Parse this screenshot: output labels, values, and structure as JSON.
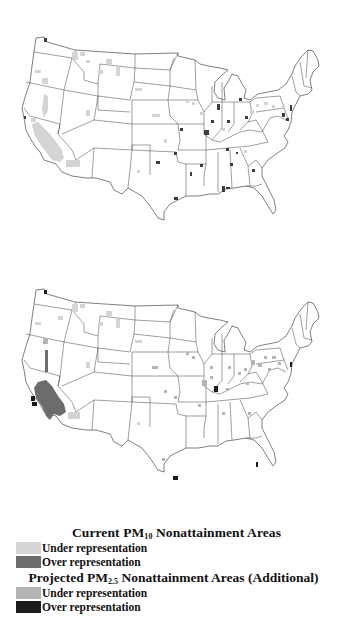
{
  "maps": [
    {
      "id": "current-pm10",
      "description": "Current PM10 nonattainment areas",
      "regions": [
        {
          "class": "pm10-under",
          "shape": "california-central",
          "x": 40,
          "y": 148
        },
        {
          "class": "pm10-under",
          "shape": "blob",
          "x": 75,
          "y": 57
        },
        {
          "class": "pm10-under",
          "shape": "blob",
          "x": 88,
          "y": 62
        },
        {
          "class": "pm10-under",
          "shape": "blob",
          "x": 110,
          "y": 62
        },
        {
          "class": "pm10-under",
          "shape": "blob",
          "x": 118,
          "y": 72
        },
        {
          "class": "pm10-under",
          "shape": "blob",
          "x": 44,
          "y": 84
        },
        {
          "class": "pm10-under",
          "shape": "blob",
          "x": 60,
          "y": 110
        },
        {
          "class": "pm10-under",
          "shape": "blob",
          "x": 88,
          "y": 110
        },
        {
          "class": "pm10-under",
          "shape": "blob",
          "x": 78,
          "y": 162
        },
        {
          "class": "pm10-under",
          "shape": "blob",
          "x": 139,
          "y": 90
        },
        {
          "class": "pm10-under",
          "shape": "blob",
          "x": 155,
          "y": 115
        },
        {
          "class": "pm10-under",
          "shape": "blob",
          "x": 190,
          "y": 100
        },
        {
          "class": "pm10-under",
          "shape": "blob",
          "x": 267,
          "y": 98
        },
        {
          "class": "pm10-under",
          "shape": "blob",
          "x": 282,
          "y": 100
        },
        {
          "class": "pm10-over",
          "shape": "dot",
          "x": 212,
          "y": 118
        },
        {
          "class": "pm10-over",
          "shape": "dot",
          "x": 228,
          "y": 122
        },
        {
          "class": "pm10-over",
          "shape": "dot",
          "x": 246,
          "y": 117
        },
        {
          "class": "pm10-over",
          "shape": "dot",
          "x": 218,
          "y": 108
        },
        {
          "class": "pm10-over",
          "shape": "dot",
          "x": 206,
          "y": 133
        },
        {
          "class": "pm10-over",
          "shape": "dot",
          "x": 228,
          "y": 148
        },
        {
          "class": "pm10-over",
          "shape": "dot",
          "x": 253,
          "y": 170
        },
        {
          "class": "pm10-over",
          "shape": "dot",
          "x": 231,
          "y": 165
        },
        {
          "class": "pm10-over",
          "shape": "dot",
          "x": 200,
          "y": 164
        },
        {
          "class": "pm10-over",
          "shape": "dot",
          "x": 180,
          "y": 130
        },
        {
          "class": "pm10-over",
          "shape": "dot",
          "x": 175,
          "y": 155
        },
        {
          "class": "pm10-over",
          "shape": "dot",
          "x": 157,
          "y": 162
        },
        {
          "class": "pm10-over",
          "shape": "dot",
          "x": 176,
          "y": 199
        },
        {
          "class": "pm10-over",
          "shape": "dot",
          "x": 222,
          "y": 190
        },
        {
          "class": "pm10-over",
          "shape": "dot",
          "x": 283,
          "y": 116
        },
        {
          "class": "pm10-over",
          "shape": "dot",
          "x": 291,
          "y": 110
        },
        {
          "class": "pm10-over",
          "shape": "dot",
          "x": 240,
          "y": 100
        },
        {
          "class": "pm10-over",
          "shape": "dot",
          "x": 45,
          "y": 40
        }
      ]
    },
    {
      "id": "projected-pm25",
      "description": "Projected PM2.5 nonattainment areas (additional)",
      "regions": [
        {
          "class": "pm10-over",
          "shape": "california-central",
          "x": 40,
          "y": 148
        },
        {
          "class": "pm10-over",
          "shape": "owens-strip",
          "x": 45,
          "y": 120
        },
        {
          "class": "pm25-over",
          "shape": "dot",
          "x": 33,
          "y": 147
        },
        {
          "class": "pm25-over",
          "shape": "dot",
          "x": 34,
          "y": 153
        },
        {
          "class": "pm25-over",
          "shape": "dot",
          "x": 216,
          "y": 136
        },
        {
          "class": "pm25-over",
          "shape": "dot",
          "x": 176,
          "y": 228
        },
        {
          "class": "pm10-under",
          "shape": "blob",
          "x": 75,
          "y": 82
        },
        {
          "class": "pm10-under",
          "shape": "blob",
          "x": 108,
          "y": 93
        },
        {
          "class": "pm10-under",
          "shape": "blob",
          "x": 76,
          "y": 190
        },
        {
          "class": "pm25-under",
          "shape": "blob",
          "x": 258,
          "y": 135
        },
        {
          "class": "pm25-under",
          "shape": "blob",
          "x": 275,
          "y": 133
        },
        {
          "class": "pm25-under",
          "shape": "blob",
          "x": 245,
          "y": 140
        },
        {
          "class": "pm25-under",
          "shape": "blob",
          "x": 205,
          "y": 162
        },
        {
          "class": "pm25-under",
          "shape": "blob",
          "x": 155,
          "y": 144
        }
      ]
    }
  ],
  "colors": {
    "pm10_under": "#d4d4d4",
    "pm10_over": "#6c6c6c",
    "pm25_under": "#b4b4b4",
    "pm25_over": "#1c1c1c",
    "outline": "#2a2a2a"
  },
  "legend": {
    "current": {
      "title_prefix": "Current  PM",
      "title_sub": "10",
      "title_suffix": " Nonattainment Areas",
      "items": [
        {
          "label": "Under representation",
          "color": "#d4d4d4"
        },
        {
          "label": "Over representation",
          "color": "#6c6c6c"
        }
      ]
    },
    "projected": {
      "title_prefix": "Projected  PM",
      "title_sub": "2.5",
      "title_suffix": " Nonattainment Areas (Additional)",
      "items": [
        {
          "label": "Under representation",
          "color": "#b4b4b4"
        },
        {
          "label": "Over representation",
          "color": "#1c1c1c"
        }
      ]
    }
  }
}
